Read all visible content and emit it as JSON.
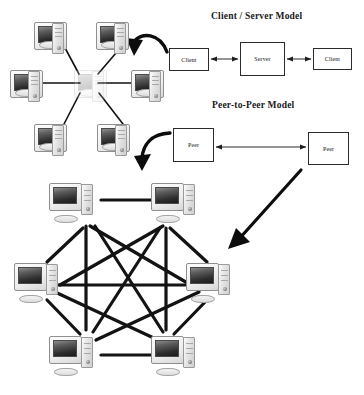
{
  "page": {
    "background": "#ffffff",
    "ink": "#1a1a1a",
    "width": 364,
    "height": 395
  },
  "headings": {
    "client_server": "Client / Server Model",
    "peer_to_peer": "Peer-to-Peer Model"
  },
  "client_server": {
    "left_client": "Client",
    "server": "Server",
    "right_client": "Client"
  },
  "peer_to_peer": {
    "left_peer": "Peer",
    "right_peer": "Peer"
  },
  "star_topology": {
    "name": "star-topology-cluster",
    "node_count": 7,
    "center_label": "hub computer",
    "outer_label": "workstation"
  },
  "mesh_topology": {
    "name": "full-mesh-cluster",
    "node_count": 6,
    "node_label": "peer computer",
    "link_count": 15
  },
  "arrows": {
    "client_to_star": "curved arrow from Client box to star topology",
    "peer_to_mesh_curve": "curved arrow from Peer box down to mesh topology",
    "peer_to_mesh_diagonal": "long diagonal arrow from right Peer box to mesh topology"
  },
  "icons": {
    "computer": "computer-icon",
    "arrow": "arrow-icon"
  }
}
